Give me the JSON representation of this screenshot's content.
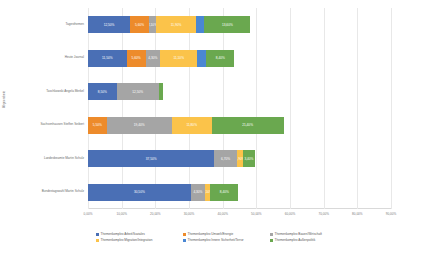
{
  "chart_data": {
    "type": "bar",
    "orientation": "horizontal",
    "stacked": true,
    "title": "",
    "xlabel": "",
    "ylabel": "Abgeordnete",
    "xlim": [
      0,
      90
    ],
    "grid": true,
    "legend_position": "bottom",
    "xticks": [
      "0,00%",
      "10,00%",
      "20,00%",
      "30,00%",
      "40,00%",
      "50,00%",
      "60,00%",
      "70,00%",
      "80,00%",
      "90,00%"
    ],
    "categories": [
      "Tagesthemen",
      "Heute Journal",
      "Taschkowski Angela Merkel",
      "Sachsenhausen Steffen Seibert",
      "Landesbeamte Martin Schulz",
      "Bundestagswahl Martin Schulz"
    ],
    "series": [
      {
        "name": "Themenkomplex Arbeit/Soziales",
        "color": "#4a6fb5",
        "values": [
          12.5,
          11.5,
          8.5,
          0.0,
          37.5,
          30.5
        ],
        "labels": [
          "12,50%",
          "11,50%",
          "8,50%",
          "",
          "37,50%",
          "30,50%"
        ]
      },
      {
        "name": "Themenkomplex Umwelt/Energie",
        "color": "#ed8b2b",
        "values": [
          5.6,
          5.6,
          0.0,
          5.5,
          0.0,
          0.0
        ],
        "labels": [
          "5,60%",
          "5,60%",
          "",
          "5,50%",
          "",
          ""
        ]
      },
      {
        "name": "Themenkomplex Bauen/Wirtschaft",
        "color": "#a5a5a5",
        "values": [
          2.1,
          4.3,
          12.5,
          19.4,
          6.7,
          4.3
        ],
        "labels": [
          "2,10%",
          "4,30%",
          "12,50%",
          "19,40%",
          "6,70%",
          "4,30%"
        ]
      },
      {
        "name": "Themenkomplex Migration/Integration",
        "color": "#fbc34a",
        "values": [
          11.9,
          11.1,
          0.0,
          11.8,
          1.9,
          1.5
        ],
        "labels": [
          "11,90%",
          "11,10%",
          "",
          "11,80%",
          "1,90%",
          "1,50%"
        ]
      },
      {
        "name": "Themenkomplex Innere Sicherheit/Terror",
        "color": "#4a87d3",
        "values": [
          2.5,
          2.6,
          0.0,
          0.0,
          0.0,
          0.0
        ],
        "labels": [
          "",
          "",
          "",
          "",
          "",
          ""
        ]
      },
      {
        "name": "Themenkomplex Außenpolitik",
        "color": "#6aa84f",
        "values": [
          13.6,
          8.4,
          1.2,
          21.4,
          3.4,
          8.4
        ],
        "labels": [
          "13,60%",
          "8,40%",
          "",
          "21,40%",
          "3,40%",
          "8,40%"
        ]
      }
    ]
  },
  "axis": {
    "y_title": "Abgeordnete"
  }
}
